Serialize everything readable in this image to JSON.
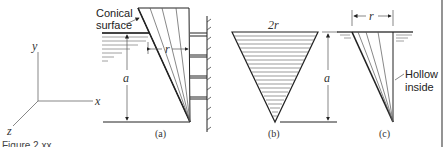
{
  "figure": {
    "caption": "Figure 2.xx",
    "axes": {
      "x_label": "x",
      "y_label": "y",
      "z_label": "z"
    },
    "panel_a": {
      "label": "(a)",
      "callout": [
        "Conical",
        "surface"
      ],
      "dim_r": "r",
      "dim_a": "a"
    },
    "panel_b": {
      "label": "(b)",
      "dim_top": "2r",
      "dim_a": "a"
    },
    "panel_c": {
      "label": "(c)",
      "dim_r": "r",
      "callout": [
        "Hollow",
        "inside"
      ]
    }
  }
}
